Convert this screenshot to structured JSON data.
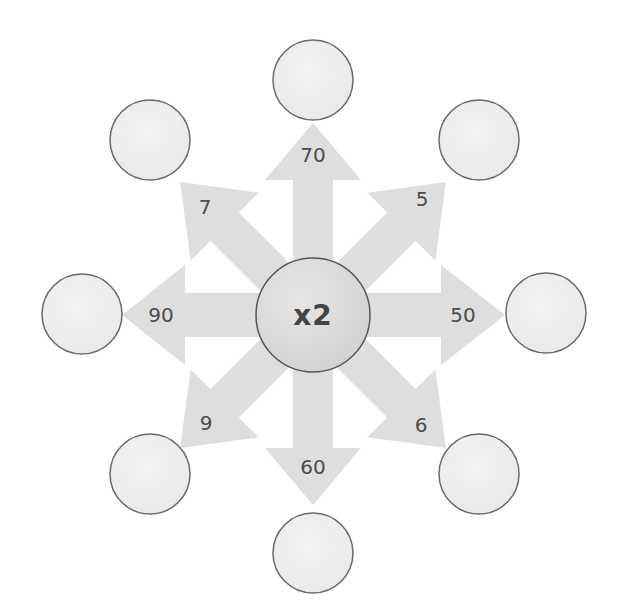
{
  "diagram": {
    "center": {
      "label": "x2",
      "fill": "#dcdcdc",
      "stroke": "#555555"
    },
    "arrow_color": "#dedede",
    "outer_circle_fill": "#efefef",
    "outer_circle_stroke": "#6a6a6a",
    "arrows": [
      {
        "direction": "up",
        "label": "70"
      },
      {
        "direction": "up-right",
        "label": "5"
      },
      {
        "direction": "right",
        "label": "50"
      },
      {
        "direction": "down-right",
        "label": "6"
      },
      {
        "direction": "down",
        "label": "60"
      },
      {
        "direction": "down-left",
        "label": "9"
      },
      {
        "direction": "left",
        "label": "90"
      },
      {
        "direction": "up-left",
        "label": "7"
      }
    ],
    "outer_circles": [
      {
        "position": "top",
        "value": ""
      },
      {
        "position": "top-right",
        "value": ""
      },
      {
        "position": "right",
        "value": ""
      },
      {
        "position": "bottom-right",
        "value": ""
      },
      {
        "position": "bottom",
        "value": ""
      },
      {
        "position": "bottom-left",
        "value": ""
      },
      {
        "position": "left",
        "value": ""
      },
      {
        "position": "top-left",
        "value": ""
      }
    ]
  }
}
